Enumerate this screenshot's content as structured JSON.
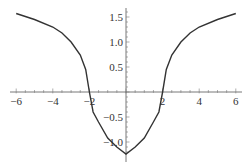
{
  "chart_data": {
    "type": "line",
    "title": "",
    "xlabel": "",
    "ylabel": "",
    "xlim": [
      -6,
      6
    ],
    "ylim": [
      -1.25,
      1.6
    ],
    "grid": false,
    "legend": null,
    "x_ticks": [
      -6,
      -4,
      -2,
      2,
      4,
      6
    ],
    "x_tick_labels": [
      "−6",
      "−4",
      "−2",
      "2",
      "4",
      "6"
    ],
    "y_ticks": [
      1.5,
      1.0,
      0.5,
      -0.5,
      -1.0
    ],
    "y_tick_labels": [
      "1.5",
      "1.0",
      "0.5",
      "−0.5",
      "−1.0"
    ],
    "series": [
      {
        "name": "f(x)",
        "color": "#333333",
        "x": [
          -6,
          -5,
          -4,
          -3.5,
          -3,
          -2.5,
          -2.2,
          -2,
          -1.8,
          -1.5,
          -1,
          -0.5,
          0,
          0.5,
          1,
          1.5,
          1.8,
          2,
          2.2,
          2.5,
          3,
          3.5,
          4,
          5,
          6
        ],
        "y": [
          1.57,
          1.45,
          1.3,
          1.18,
          1.0,
          0.74,
          0.45,
          0.0,
          -0.4,
          -0.6,
          -0.92,
          -1.1,
          -1.24,
          -1.1,
          -0.92,
          -0.6,
          -0.4,
          0.0,
          0.45,
          0.74,
          1.0,
          1.18,
          1.3,
          1.45,
          1.57
        ]
      }
    ]
  }
}
